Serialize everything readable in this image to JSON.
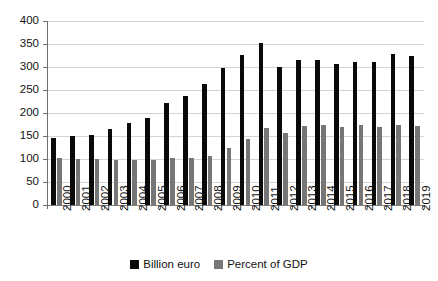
{
  "chart_data": {
    "type": "bar",
    "title": "",
    "subtitle": "",
    "xlabel": "",
    "ylabel": "",
    "ylim": [
      0,
      400
    ],
    "yticks": [
      0,
      50,
      100,
      150,
      200,
      250,
      300,
      350,
      400
    ],
    "grid": true,
    "legend_position": "bottom-center",
    "categories": [
      "2000",
      "2001",
      "2002",
      "2003",
      "2004",
      "2005",
      "2006",
      "2007",
      "2008",
      "2009",
      "2010",
      "2011",
      "2012",
      "2013",
      "2014",
      "2015",
      "2016",
      "2017",
      "2018",
      "2019"
    ],
    "series": [
      {
        "name": "Billion euro",
        "color": "#0a0a0a",
        "values": [
          145,
          149,
          153,
          166,
          178,
          190,
          222,
          238,
          262,
          298,
          327,
          352,
          301,
          315,
          315,
          307,
          310,
          311,
          329,
          325
        ]
      },
      {
        "name": "Percent of GDP",
        "color": "#767676",
        "values": [
          102,
          101,
          99,
          97,
          98,
          98,
          103,
          102,
          106,
          123,
          143,
          168,
          156,
          172,
          173,
          170,
          173,
          170,
          175,
          171
        ]
      }
    ]
  },
  "legend": {
    "items": [
      {
        "label": "Billion euro",
        "color": "#0a0a0a",
        "swatch": "black"
      },
      {
        "label": "Percent of GDP",
        "color": "#767676",
        "swatch": "gray"
      }
    ]
  }
}
